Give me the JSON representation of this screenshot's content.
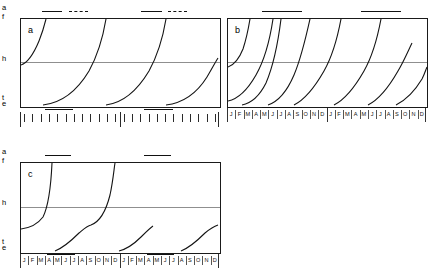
{
  "figure": {
    "panels": [
      {
        "id": "a",
        "label": "a",
        "y_axis_labels": {
          "top_upper": "a",
          "top_lower": "f",
          "middle": "h",
          "bottom_upper": "t",
          "bottom_lower": "e"
        },
        "x_axis_type": "ticks",
        "x_tick_count_per_year": 12,
        "years": 2,
        "month_labels": [],
        "top_bars": [
          {
            "start_month": 2.6,
            "end_month": 5.1,
            "style": "solid"
          },
          {
            "start_month": 5.9,
            "end_month": 8.2,
            "style": "dashed"
          },
          {
            "start_month": 14.6,
            "end_month": 17.1,
            "style": "solid"
          },
          {
            "start_month": 17.9,
            "end_month": 20.2,
            "style": "dashed"
          }
        ],
        "bottom_bars": [
          {
            "start_month": 3.0,
            "end_month": 6.4,
            "style": "solid"
          },
          {
            "start_month": 15.0,
            "end_month": 18.4,
            "style": "solid"
          }
        ],
        "curves": [
          "M 0,46 C 6,44 13,34 18,22 C 22,12 24,4 25,0",
          "M 22,86 C 40,84 56,72 68,52 C 78,34 83,12 85,0",
          "M 85,86 C 101,84 116,72 128,52 C 138,34 143,12 145,0",
          "M 145,86 C 162,84 176,74 186,58 C 192,48 195,42 197,39"
        ]
      },
      {
        "id": "b",
        "label": "b",
        "y_axis_labels": {
          "top_upper": "",
          "top_lower": "",
          "middle": "",
          "bottom_upper": "",
          "bottom_lower": ""
        },
        "x_axis_type": "months",
        "x_tick_count_per_year": 12,
        "years": 2,
        "month_labels": [
          "J",
          "F",
          "M",
          "A",
          "M",
          "J",
          "J",
          "A",
          "S",
          "O",
          "N",
          "D"
        ],
        "top_bars": [
          {
            "start_month": 4.2,
            "end_month": 9.0,
            "style": "solid"
          },
          {
            "start_month": 16.2,
            "end_month": 21.0,
            "style": "solid"
          }
        ],
        "bottom_bars": [
          {
            "start_month": 4.2,
            "end_month": 9.0,
            "style": "solid"
          },
          {
            "start_month": 16.2,
            "end_month": 21.0,
            "style": "solid"
          }
        ],
        "curves": [
          "M 0,48 C 6,46 11,40 15,30 C 19,18 21,6 22,0",
          "M 0,82 C 10,80 20,70 28,56 C 36,42 42,20 45,0",
          "M 14,86 C 24,84 32,76 38,64 C 44,50 50,24 53,0",
          "M 40,86 C 52,82 60,70 66,56 C 72,42 78,18 82,0",
          "M 66,86 C 78,80 88,66 96,52 C 104,38 110,16 113,0",
          "M 106,86 C 118,80 128,66 136,52 C 144,38 150,16 153,0",
          "M 140,86 C 152,80 162,66 170,52 C 176,42 181,30 184,24",
          "M 168,86 C 180,80 188,70 194,60 C 197,54 198,50 199,48"
        ]
      },
      {
        "id": "c",
        "label": "c",
        "y_axis_labels": {
          "top_upper": "a",
          "top_lower": "f",
          "middle": "h",
          "bottom_upper": "t",
          "bottom_lower": "e"
        },
        "x_axis_type": "months",
        "x_tick_count_per_year": 12,
        "years": 2,
        "month_labels": [
          "J",
          "F",
          "M",
          "A",
          "M",
          "J",
          "J",
          "A",
          "S",
          "O",
          "N",
          "D"
        ],
        "top_bars": [
          {
            "start_month": 3.0,
            "end_month": 6.2,
            "style": "solid"
          },
          {
            "start_month": 15.0,
            "end_month": 18.2,
            "style": "solid"
          }
        ],
        "bottom_bars": [
          {
            "start_month": 3.3,
            "end_month": 6.6,
            "style": "solid"
          },
          {
            "start_month": 15.3,
            "end_month": 18.6,
            "style": "solid"
          }
        ],
        "curves": [
          "M 0,66 C 8,65 16,62 22,54 C 27,44 30,22 31,0",
          "M 34,88 C 44,84 52,76 58,70 C 64,65 66,63 70,62 C 78,59 85,48 89,32 C 92,18 93,6 94,0",
          "M 98,88 C 106,86 114,80 120,74 C 126,68 129,65 132,63",
          "M 160,88 C 170,84 178,76 184,70 C 190,65 194,63 197,62"
        ]
      }
    ]
  }
}
